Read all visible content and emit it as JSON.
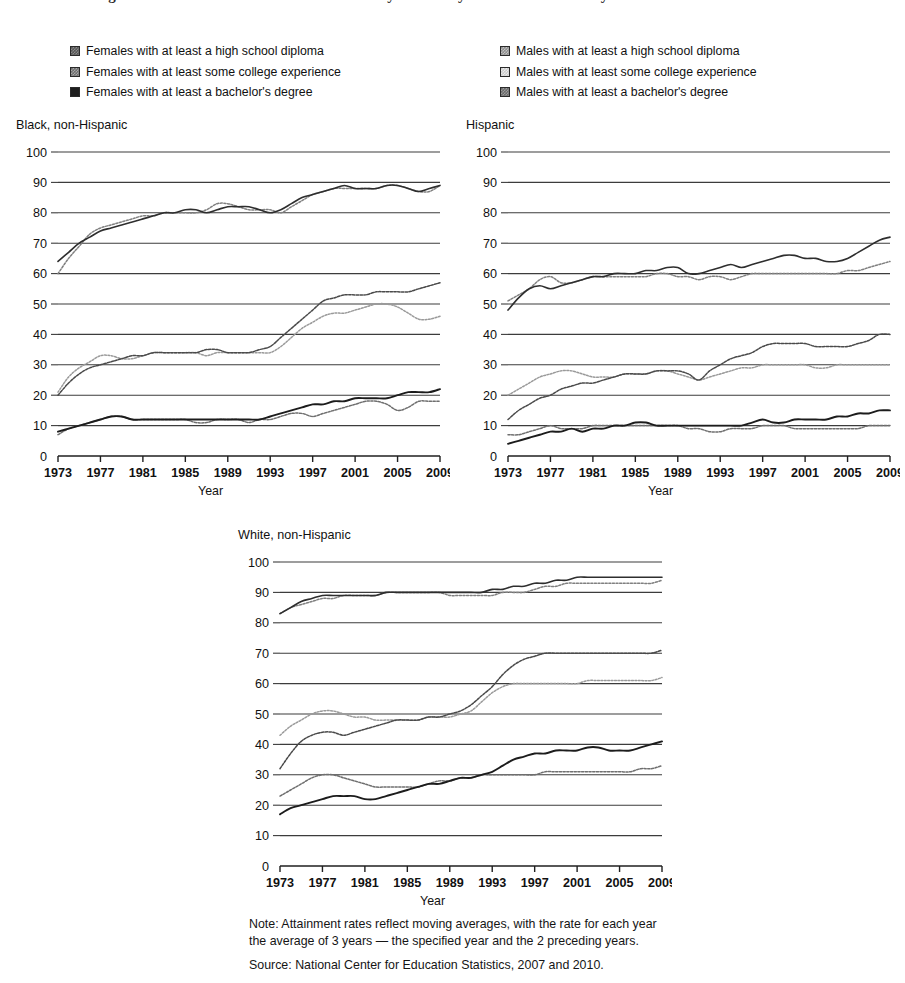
{
  "page": {
    "truncated_heading": "Figure 2. Educational attainment of 25- to 29-year-olds by sex and race/ethnicity: 1973-2009"
  },
  "legends": {
    "female": {
      "name": "females-legend",
      "items": [
        {
          "swatch": "swatch-female-high-school",
          "label": "Females with at least a high school diploma"
        },
        {
          "swatch": "swatch-female-some-college",
          "label": "Females with at least some college experience"
        },
        {
          "swatch": "swatch-female-bachelors",
          "label": "Females with at least a bachelor's degree"
        }
      ]
    },
    "male": {
      "name": "males-legend",
      "items": [
        {
          "swatch": "swatch-male-high-school",
          "label": "Males with at least a high school diploma"
        },
        {
          "swatch": "swatch-male-some-college",
          "label": "Males with at least some college experience"
        },
        {
          "swatch": "swatch-male-bachelors",
          "label": "Males with at least a bachelor's degree"
        }
      ]
    }
  },
  "footer": {
    "note_line1": "Note: Attainment rates reflect moving averages, with the rate for each year",
    "note_line2": "the average of 3 years — the specified year and the 2 preceding years.",
    "source": "Source: National Center for Education Statistics, 2007 and 2010."
  },
  "chart_data": [
    {
      "id": "black-non-hispanic",
      "type": "line",
      "title": "Black, non-Hispanic",
      "xlabel": "Year",
      "ylabel": "",
      "xlim": [
        1973,
        2009
      ],
      "ylim": [
        0,
        100
      ],
      "grid": true,
      "legend_position": "above-figure",
      "xticks": [
        1973,
        1977,
        1981,
        1985,
        1989,
        1993,
        1997,
        2001,
        2005,
        2009
      ],
      "yticks": [
        0,
        10,
        20,
        30,
        40,
        50,
        60,
        70,
        80,
        90,
        100
      ],
      "x": [
        1973,
        1974,
        1975,
        1976,
        1977,
        1978,
        1979,
        1980,
        1981,
        1982,
        1983,
        1984,
        1985,
        1986,
        1987,
        1988,
        1989,
        1990,
        1991,
        1992,
        1993,
        1994,
        1995,
        1996,
        1997,
        1998,
        1999,
        2000,
        2001,
        2002,
        2003,
        2004,
        2005,
        2006,
        2007,
        2008,
        2009
      ],
      "series": [
        {
          "name": "Females with at least a high school diploma",
          "values": [
            64,
            67,
            70,
            72,
            74,
            75,
            76,
            77,
            78,
            79,
            80,
            80,
            81,
            81,
            80,
            81,
            82,
            82,
            82,
            81,
            80,
            81,
            83,
            85,
            86,
            87,
            88,
            89,
            88,
            88,
            88,
            89,
            89,
            88,
            87,
            88,
            89
          ]
        },
        {
          "name": "Males with at least a high school diploma",
          "values": [
            60,
            65,
            69,
            73,
            75,
            76,
            77,
            78,
            79,
            79,
            80,
            80,
            80,
            80,
            81,
            83,
            83,
            82,
            81,
            81,
            81,
            80,
            82,
            84,
            86,
            87,
            88,
            88,
            88,
            88,
            88,
            89,
            89,
            88,
            87,
            87,
            89
          ]
        },
        {
          "name": "Females with at least some college experience",
          "values": [
            20,
            24,
            27,
            29,
            30,
            31,
            32,
            33,
            33,
            34,
            34,
            34,
            34,
            34,
            35,
            35,
            34,
            34,
            34,
            35,
            36,
            39,
            42,
            45,
            48,
            51,
            52,
            53,
            53,
            53,
            54,
            54,
            54,
            54,
            55,
            56,
            57
          ]
        },
        {
          "name": "Males with at least some college experience",
          "values": [
            21,
            26,
            29,
            31,
            33,
            33,
            32,
            32,
            33,
            34,
            34,
            34,
            34,
            34,
            33,
            34,
            34,
            34,
            34,
            34,
            34,
            36,
            39,
            42,
            44,
            46,
            47,
            47,
            48,
            49,
            50,
            50,
            49,
            47,
            45,
            45,
            46
          ]
        },
        {
          "name": "Females with at least a bachelor's degree",
          "values": [
            8,
            9,
            10,
            11,
            12,
            13,
            13,
            12,
            12,
            12,
            12,
            12,
            12,
            12,
            12,
            12,
            12,
            12,
            12,
            12,
            13,
            14,
            15,
            16,
            17,
            17,
            18,
            18,
            19,
            19,
            19,
            19,
            20,
            21,
            21,
            21,
            22
          ]
        },
        {
          "name": "Males with at least a bachelor's degree",
          "values": [
            7,
            9,
            10,
            11,
            12,
            13,
            13,
            12,
            12,
            12,
            12,
            12,
            12,
            11,
            11,
            12,
            12,
            12,
            11,
            12,
            12,
            13,
            14,
            14,
            13,
            14,
            15,
            16,
            17,
            18,
            18,
            17,
            15,
            16,
            18,
            18,
            18
          ]
        }
      ]
    },
    {
      "id": "hispanic",
      "type": "line",
      "title": "Hispanic",
      "xlabel": "Year",
      "ylabel": "",
      "xlim": [
        1973,
        2009
      ],
      "ylim": [
        0,
        100
      ],
      "grid": true,
      "legend_position": "above-figure",
      "xticks": [
        1973,
        1977,
        1981,
        1985,
        1989,
        1993,
        1997,
        2001,
        2005,
        2009
      ],
      "yticks": [
        0,
        10,
        20,
        30,
        40,
        50,
        60,
        70,
        80,
        90,
        100
      ],
      "x": [
        1973,
        1974,
        1975,
        1976,
        1977,
        1978,
        1979,
        1980,
        1981,
        1982,
        1983,
        1984,
        1985,
        1986,
        1987,
        1988,
        1989,
        1990,
        1991,
        1992,
        1993,
        1994,
        1995,
        1996,
        1997,
        1998,
        1999,
        2000,
        2001,
        2002,
        2003,
        2004,
        2005,
        2006,
        2007,
        2008,
        2009
      ],
      "series": [
        {
          "name": "Females with at least a high school diploma",
          "values": [
            48,
            52,
            55,
            56,
            55,
            56,
            57,
            58,
            59,
            59,
            60,
            60,
            60,
            61,
            61,
            62,
            62,
            60,
            60,
            61,
            62,
            63,
            62,
            63,
            64,
            65,
            66,
            66,
            65,
            65,
            64,
            64,
            65,
            67,
            69,
            71,
            72
          ]
        },
        {
          "name": "Males with at least a high school diploma",
          "values": [
            51,
            53,
            55,
            58,
            59,
            57,
            57,
            58,
            59,
            59,
            59,
            59,
            59,
            59,
            60,
            60,
            59,
            59,
            58,
            59,
            59,
            58,
            59,
            60,
            60,
            60,
            60,
            60,
            60,
            60,
            60,
            60,
            61,
            61,
            62,
            63,
            64
          ]
        },
        {
          "name": "Females with at least some college experience",
          "values": [
            12,
            15,
            17,
            19,
            20,
            22,
            23,
            24,
            24,
            25,
            26,
            27,
            27,
            27,
            28,
            28,
            28,
            27,
            25,
            28,
            30,
            32,
            33,
            34,
            36,
            37,
            37,
            37,
            37,
            36,
            36,
            36,
            36,
            37,
            38,
            40,
            40
          ]
        },
        {
          "name": "Males with at least some college experience",
          "values": [
            20,
            22,
            24,
            26,
            27,
            28,
            28,
            27,
            26,
            26,
            26,
            27,
            27,
            27,
            28,
            28,
            27,
            26,
            25,
            26,
            27,
            28,
            29,
            29,
            30,
            30,
            30,
            30,
            30,
            29,
            29,
            30,
            30,
            30,
            30,
            30,
            30
          ]
        },
        {
          "name": "Females with at least a bachelor's degree",
          "values": [
            4,
            5,
            6,
            7,
            8,
            8,
            9,
            8,
            9,
            9,
            10,
            10,
            11,
            11,
            10,
            10,
            10,
            10,
            10,
            10,
            10,
            10,
            10,
            11,
            12,
            11,
            11,
            12,
            12,
            12,
            12,
            13,
            13,
            14,
            14,
            15,
            15
          ]
        },
        {
          "name": "Males with at least a bachelor's degree",
          "values": [
            7,
            7,
            8,
            9,
            10,
            9,
            9,
            9,
            10,
            10,
            10,
            10,
            10,
            10,
            10,
            10,
            10,
            9,
            9,
            8,
            8,
            9,
            9,
            9,
            10,
            10,
            10,
            9,
            9,
            9,
            9,
            9,
            9,
            9,
            10,
            10,
            10
          ]
        }
      ]
    },
    {
      "id": "white-non-hispanic",
      "type": "line",
      "title": "White, non-Hispanic",
      "xlabel": "Year",
      "ylabel": "",
      "xlim": [
        1973,
        2009
      ],
      "ylim": [
        0,
        100
      ],
      "grid": true,
      "legend_position": "above-figure",
      "xticks": [
        1973,
        1977,
        1981,
        1985,
        1989,
        1993,
        1997,
        2001,
        2005,
        2009
      ],
      "yticks": [
        0,
        10,
        20,
        30,
        40,
        50,
        60,
        70,
        80,
        90,
        100
      ],
      "x": [
        1973,
        1974,
        1975,
        1976,
        1977,
        1978,
        1979,
        1980,
        1981,
        1982,
        1983,
        1984,
        1985,
        1986,
        1987,
        1988,
        1989,
        1990,
        1991,
        1992,
        1993,
        1994,
        1995,
        1996,
        1997,
        1998,
        1999,
        2000,
        2001,
        2002,
        2003,
        2004,
        2005,
        2006,
        2007,
        2008,
        2009
      ],
      "series": [
        {
          "name": "Females with at least a high school diploma",
          "values": [
            83,
            85,
            87,
            88,
            89,
            89,
            89,
            89,
            89,
            89,
            90,
            90,
            90,
            90,
            90,
            90,
            90,
            90,
            90,
            90,
            91,
            91,
            92,
            92,
            93,
            93,
            94,
            94,
            95,
            95,
            95,
            95,
            95,
            95,
            95,
            95,
            95
          ]
        },
        {
          "name": "Males with at least a high school diploma",
          "values": [
            83,
            85,
            86,
            87,
            88,
            88,
            89,
            89,
            89,
            89,
            90,
            90,
            90,
            90,
            90,
            90,
            89,
            89,
            89,
            89,
            89,
            90,
            90,
            90,
            91,
            92,
            92,
            93,
            93,
            93,
            93,
            93,
            93,
            93,
            93,
            93,
            94
          ]
        },
        {
          "name": "Females with at least some college experience",
          "values": [
            32,
            37,
            41,
            43,
            44,
            44,
            43,
            44,
            45,
            46,
            47,
            48,
            48,
            48,
            49,
            49,
            50,
            51,
            53,
            56,
            59,
            63,
            66,
            68,
            69,
            70,
            70,
            70,
            70,
            70,
            70,
            70,
            70,
            70,
            70,
            70,
            71
          ]
        },
        {
          "name": "Males with at least some college experience",
          "values": [
            43,
            46,
            48,
            50,
            51,
            51,
            50,
            49,
            49,
            48,
            48,
            48,
            48,
            48,
            49,
            49,
            49,
            50,
            51,
            54,
            57,
            59,
            60,
            60,
            60,
            60,
            60,
            60,
            60,
            61,
            61,
            61,
            61,
            61,
            61,
            61,
            62
          ]
        },
        {
          "name": "Females with at least a bachelor's degree",
          "values": [
            17,
            19,
            20,
            21,
            22,
            23,
            23,
            23,
            22,
            22,
            23,
            24,
            25,
            26,
            27,
            27,
            28,
            29,
            29,
            30,
            31,
            33,
            35,
            36,
            37,
            37,
            38,
            38,
            38,
            39,
            39,
            38,
            38,
            38,
            39,
            40,
            41
          ]
        },
        {
          "name": "Males with at least a bachelor's degree",
          "values": [
            23,
            25,
            27,
            29,
            30,
            30,
            29,
            28,
            27,
            26,
            26,
            26,
            26,
            26,
            27,
            28,
            28,
            29,
            29,
            30,
            30,
            30,
            30,
            30,
            30,
            31,
            31,
            31,
            31,
            31,
            31,
            31,
            31,
            31,
            32,
            32,
            33
          ]
        }
      ]
    }
  ]
}
